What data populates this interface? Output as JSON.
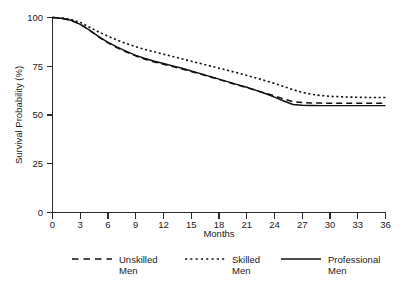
{
  "chart_data": {
    "type": "line",
    "title": "",
    "xlabel": "Months",
    "ylabel": "Survival Probability (%)",
    "xlim": [
      0,
      36
    ],
    "ylim": [
      0,
      100
    ],
    "xticks": [
      0,
      3,
      6,
      9,
      12,
      15,
      18,
      21,
      24,
      27,
      30,
      33,
      36
    ],
    "yticks": [
      0,
      25,
      50,
      75,
      100
    ],
    "xtick_labels": [
      "0",
      "3",
      "6",
      "9",
      "12",
      "15",
      "18",
      "21",
      "24",
      "27",
      "30",
      "33",
      "36"
    ],
    "ytick_labels": [
      "0",
      "25",
      "50",
      "75",
      "100"
    ],
    "grid": false,
    "legend_position": "below",
    "x": [
      0,
      1,
      2,
      3,
      4,
      5,
      6,
      7,
      8,
      9,
      10,
      11,
      12,
      13,
      14,
      15,
      16,
      17,
      18,
      19,
      20,
      21,
      22,
      23,
      24,
      25,
      26,
      27,
      28,
      29,
      30,
      31,
      32,
      33,
      34,
      35,
      36
    ],
    "series": [
      {
        "name": "Unskilled Men",
        "style": "dashed",
        "color": "#101010",
        "values": [
          100,
          99.6,
          98.6,
          96.5,
          93.5,
          90.0,
          87.0,
          84.5,
          82.3,
          80.3,
          78.6,
          77.2,
          76.0,
          74.8,
          73.6,
          72.3,
          71.0,
          69.6,
          68.2,
          66.8,
          65.4,
          64.0,
          62.6,
          61.2,
          59.8,
          58.2,
          56.8,
          56.4,
          56.2,
          56.1,
          56.0,
          56.0,
          56.0,
          56.0,
          56.0,
          56.0,
          56.0
        ]
      },
      {
        "name": "Skilled Men",
        "style": "dotted",
        "color": "#101010",
        "values": [
          100,
          99.7,
          99.0,
          97.5,
          95.0,
          92.6,
          90.4,
          88.4,
          86.6,
          85.0,
          83.6,
          82.4,
          81.2,
          80.0,
          78.8,
          77.6,
          76.4,
          75.2,
          74.0,
          72.8,
          71.6,
          70.3,
          69.0,
          67.6,
          66.2,
          64.6,
          63.0,
          61.6,
          60.6,
          60.0,
          59.6,
          59.4,
          59.2,
          59.1,
          59.0,
          59.0,
          59.0
        ]
      },
      {
        "name": "Professional Men",
        "style": "solid",
        "color": "#101010",
        "values": [
          100,
          99.6,
          98.6,
          96.5,
          93.5,
          90.2,
          87.2,
          84.8,
          82.6,
          80.6,
          79.0,
          77.6,
          76.4,
          75.2,
          74.0,
          72.6,
          71.2,
          69.8,
          68.4,
          67.0,
          65.6,
          64.2,
          62.6,
          61.0,
          59.2,
          57.2,
          55.4,
          55.0,
          54.9,
          54.8,
          54.8,
          54.8,
          54.8,
          54.8,
          54.8,
          54.8,
          54.8
        ]
      }
    ],
    "legend": [
      {
        "label_line1": "Unskilled",
        "label_line2": "Men",
        "style": "dashed"
      },
      {
        "label_line1": "Skilled",
        "label_line2": "Men",
        "style": "dotted"
      },
      {
        "label_line1": "Professional",
        "label_line2": "Men",
        "style": "solid"
      }
    ]
  }
}
